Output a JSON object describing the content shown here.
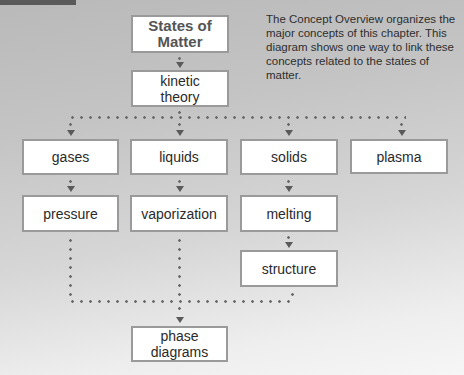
{
  "note": "The Concept Overview organizes the major concepts of this chapter. This diagram shows one way to link these concepts related to the states of matter.",
  "nodes": {
    "root": "States of Matter",
    "kinetic_theory": "kinetic theory",
    "gases": "gases",
    "liquids": "liquids",
    "solids": "solids",
    "plasma": "plasma",
    "pressure": "pressure",
    "vaporization": "vaporization",
    "melting": "melting",
    "structure": "structure",
    "phase_diagrams": "phase diagrams"
  },
  "edges": [
    [
      "States of Matter",
      "kinetic theory"
    ],
    [
      "kinetic theory",
      "gases"
    ],
    [
      "kinetic theory",
      "liquids"
    ],
    [
      "kinetic theory",
      "solids"
    ],
    [
      "kinetic theory",
      "plasma"
    ],
    [
      "gases",
      "pressure"
    ],
    [
      "liquids",
      "vaporization"
    ],
    [
      "solids",
      "melting"
    ],
    [
      "melting",
      "structure"
    ],
    [
      "pressure",
      "phase diagrams"
    ],
    [
      "vaporization",
      "phase diagrams"
    ],
    [
      "structure",
      "phase diagrams"
    ]
  ],
  "colors": {
    "box_border": "#9a9a9a",
    "box_fill": "#ffffff",
    "connector": "#6a6a6a",
    "title_text": "#555555"
  }
}
